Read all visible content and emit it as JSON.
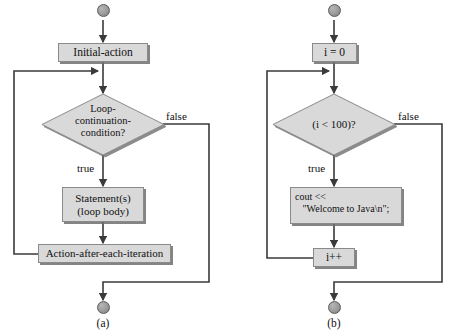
{
  "figure": {
    "background": "#ffffff",
    "node_fill": "#d9d9d9",
    "node_stroke": "#8a8a8a",
    "line_color": "#3a3a3a",
    "text_color": "#111111"
  },
  "panels": [
    {
      "key": "a",
      "caption": "(a)",
      "nodes": {
        "start_terminal": "start",
        "initial_action": "Initial-action",
        "condition_line1": "Loop-",
        "condition_line2": "continuation-",
        "condition_line3": "condition?",
        "statements_line1": "Statement(s)",
        "statements_line2": "(loop body)",
        "action_after": "Action-after-each-iteration",
        "end_terminal": "end"
      },
      "edge_labels": {
        "false": "false",
        "true": "true"
      }
    },
    {
      "key": "b",
      "caption": "(b)",
      "nodes": {
        "start_terminal": "start",
        "initial_action": "i = 0",
        "condition": "(i < 100)?",
        "body_line1": "cout <<",
        "body_line2": "   \"Welcome to Java\\n\";",
        "action_after": "i++",
        "end_terminal": "end"
      },
      "edge_labels": {
        "false": "false",
        "true": "true"
      }
    }
  ]
}
